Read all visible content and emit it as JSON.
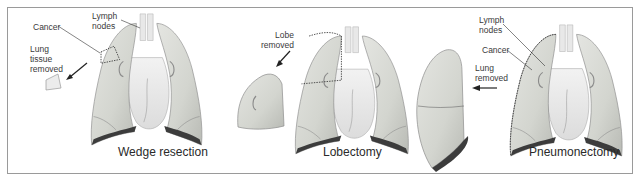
{
  "figure": {
    "panels": [
      {
        "id": "wedge",
        "title": "Wedge resection",
        "labels": {
          "cancer": "Cancer",
          "lymph_nodes": "Lymph\nnodes",
          "removed": "Lung\ntissue\nremoved"
        }
      },
      {
        "id": "lobectomy",
        "title": "Lobectomy",
        "labels": {
          "removed": "Lobe\nremoved"
        }
      },
      {
        "id": "pneumonectomy",
        "title": "Pneumonectomy",
        "labels": {
          "lymph_nodes": "Lymph\nnodes",
          "cancer": "Cancer",
          "removed": "Lung\nremoved"
        }
      }
    ],
    "colors": {
      "frame_border": "#9a9a9a",
      "lung_fill": "#d9dbd6",
      "lung_shadow": "#3c3c3c",
      "heart_fill": "#eeeeee",
      "label_text": "#3a3a3a"
    }
  }
}
